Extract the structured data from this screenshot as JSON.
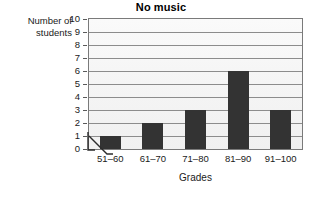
{
  "chart_data": {
    "type": "bar",
    "title": "No music",
    "xlabel": "Grades",
    "ylabel": "Number of students",
    "ylabel_lines": [
      "Number of",
      "students"
    ],
    "categories": [
      "51–60",
      "61–70",
      "71–80",
      "81–90",
      "91–100"
    ],
    "values": [
      1,
      2,
      3,
      6,
      3
    ],
    "ylim": [
      0,
      10
    ],
    "ytick_labels": [
      "0",
      "1",
      "2",
      "3",
      "4",
      "5",
      "6",
      "7",
      "8",
      "9",
      "10"
    ],
    "ytick_values": [
      0,
      1,
      2,
      3,
      4,
      5,
      6,
      7,
      8,
      9,
      10
    ],
    "grid": true,
    "grid_axis": "y",
    "legend": null,
    "axis_break": true,
    "axis_break_note": "zigzag break mark on x-axis near origin",
    "colors": {
      "bar": "#333333",
      "plot_background": "#f2f2f2",
      "gridline": "#8c8c8c",
      "frame": "#7a7a7a",
      "text": "#1a1a1a",
      "page_background": "#ffffff"
    }
  }
}
